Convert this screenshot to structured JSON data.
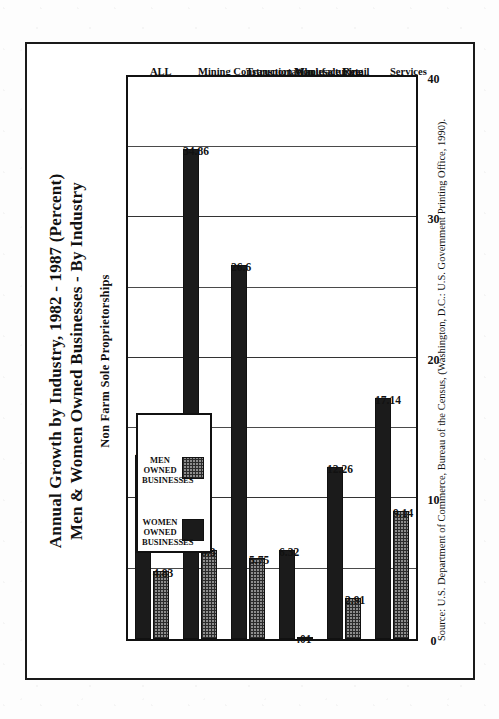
{
  "document": {
    "kind": "scanned-chart-page",
    "title_line1": "Annual Growth by Industry, 1982 - 1987 (Percent)",
    "title_line2": "Men & Women Owned Businesses - By Industry",
    "subtitle": "Non Farm Sole Proprietorships",
    "source": "Source: U.S. Department of Commerce, Bureau of the Census, (Washington, D.C.: U.S. Government Printing Office, 1990)."
  },
  "colors": {
    "women_fill": "#1b1b1b",
    "men_fill": "#8d8d8d",
    "men_hatch": "#2b2b2b",
    "frame": "#1a1a1a",
    "grid": "#4a4a4a",
    "paper": "#fdfdfd"
  },
  "chart_data": {
    "type": "bar",
    "orientation": "horizontal",
    "title": "Annual Growth by Industry, 1982 - 1987 (Percent) Men & Women Owned Businesses - By Industry",
    "subtitle": "Non Farm Sole Proprietorships",
    "xlabel": "",
    "ylabel": "Percent",
    "xlim": [
      0,
      40
    ],
    "ticks": [
      "0",
      "10",
      "20",
      "30",
      "40"
    ],
    "tick_values": [
      0,
      10,
      20,
      30,
      40
    ],
    "minor_gridline_step": 5,
    "grid": true,
    "legend_position": "upper-left",
    "categories": [
      "ALL",
      "Mining\nConstruction\nManufacturing",
      "Transportation",
      "Wholesale\nRetail",
      "Fire",
      "Services"
    ],
    "series": [
      {
        "name": "WOMEN OWNED BUSINESSES",
        "values": [
          13.1,
          34.86,
          26.6,
          6.32,
          12.26,
          17.14
        ],
        "labels": [
          "13.1",
          "34.86",
          "26.6",
          "6.32",
          "12.26",
          "17.14"
        ]
      },
      {
        "name": "MEN OWNED BUSINESSES",
        "values": [
          4.83,
          6.3,
          5.75,
          0.01,
          2.91,
          9.14
        ],
        "labels": [
          "4.83",
          "6.3",
          "5.75",
          ".01",
          "2.91",
          "9.14"
        ]
      }
    ]
  },
  "legend": {
    "entries": [
      {
        "label": "WOMEN OWNED\nBUSINESSES",
        "swatch": "solid-black"
      },
      {
        "label": "MEN OWNED\nBUSINESSES",
        "swatch": "cross-hatch"
      }
    ]
  }
}
